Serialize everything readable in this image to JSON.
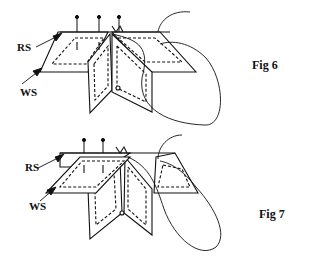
{
  "figures": [
    {
      "caption": "Fig 6",
      "labels": {
        "rs": "RS",
        "ws": "WS"
      },
      "pins": 3
    },
    {
      "caption": "Fig 7",
      "labels": {
        "rs": "RS",
        "ws": "WS"
      },
      "pins": 2
    }
  ],
  "colors": {
    "ink": "#111111",
    "background": "#ffffff"
  }
}
